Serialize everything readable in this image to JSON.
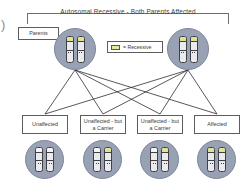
{
  "diagram": {
    "title": "Autosomal Recessive - Both Parents Affected",
    "edge_artifact": ")",
    "parents_label": "Parents",
    "legend": {
      "symbol_name": "recessive-allele-swatch",
      "text": "= Recessive",
      "color": "#dfe394"
    },
    "colors": {
      "cell_fill": "#99a2b4",
      "chromosome_fill": "#e9ebee",
      "recessive_band": "#dfe394",
      "outline": "#3f3f44",
      "box_border": "#5d5d5d",
      "text": "#3c3c3c"
    },
    "parents": [
      {
        "id": "parent-left",
        "genotype": "affected",
        "chromosomes": [
          {
            "recessive": true
          },
          {
            "recessive": true
          }
        ]
      },
      {
        "id": "parent-right",
        "genotype": "affected",
        "chromosomes": [
          {
            "recessive": true
          },
          {
            "recessive": true
          }
        ]
      }
    ],
    "offspring": [
      {
        "id": "offspring-1",
        "label": "Unaffected",
        "chromosomes": [
          {
            "recessive": false
          },
          {
            "recessive": false
          }
        ]
      },
      {
        "id": "offspring-2",
        "label": "Unaffected - but a Carrier",
        "chromosomes": [
          {
            "recessive": false
          },
          {
            "recessive": true
          }
        ]
      },
      {
        "id": "offspring-3",
        "label": "Unaffected - but a Carrier",
        "chromosomes": [
          {
            "recessive": false
          },
          {
            "recessive": true
          }
        ]
      },
      {
        "id": "offspring-4",
        "label": "Affected",
        "chromosomes": [
          {
            "recessive": true
          },
          {
            "recessive": true
          }
        ]
      }
    ]
  }
}
